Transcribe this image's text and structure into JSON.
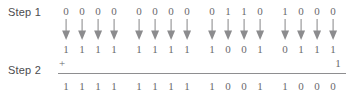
{
  "diagram": {
    "colors": {
      "text": "#58585a",
      "digit": "#6a6a6c",
      "arrow": "#8c8c8e",
      "rule": "#8e8e90",
      "background": "#ffffff"
    },
    "labels": {
      "step1": "Step 1",
      "step2": "Step 2"
    },
    "operator": "+",
    "carry_in": "1",
    "nibble_count": 4,
    "bits_per_nibble": 4,
    "arrow_icon": "down-arrow-icon",
    "rows": {
      "top": {
        "name": "original-value",
        "nibbles": [
          [
            "0",
            "0",
            "0",
            "0"
          ],
          [
            "0",
            "0",
            "0",
            "0"
          ],
          [
            "0",
            "1",
            "1",
            "0"
          ],
          [
            "1",
            "0",
            "0",
            "0"
          ]
        ]
      },
      "arrows": {
        "name": "invert-arrows",
        "nibbles": [
          [
            "down",
            "down",
            "down",
            "down"
          ],
          [
            "down",
            "down",
            "down",
            "down"
          ],
          [
            "down",
            "down",
            "down",
            "down"
          ],
          [
            "down",
            "down",
            "down",
            "down"
          ]
        ]
      },
      "middle": {
        "name": "ones-complement",
        "nibbles": [
          [
            "1",
            "1",
            "1",
            "1"
          ],
          [
            "1",
            "1",
            "1",
            "1"
          ],
          [
            "1",
            "0",
            "0",
            "1"
          ],
          [
            "0",
            "1",
            "1",
            "1"
          ]
        ]
      },
      "bottom": {
        "name": "twos-complement-result",
        "nibbles": [
          [
            "1",
            "1",
            "1",
            "1"
          ],
          [
            "1",
            "1",
            "1",
            "1"
          ],
          [
            "1",
            "0",
            "0",
            "1"
          ],
          [
            "1",
            "0",
            "0",
            "0"
          ]
        ]
      }
    }
  }
}
